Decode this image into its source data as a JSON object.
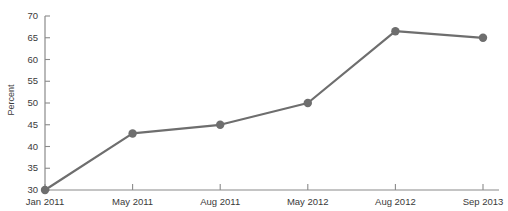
{
  "chart_data": {
    "type": "line",
    "title": "",
    "title_clipped": true,
    "xlabel": "",
    "ylabel": "Percent",
    "categories": [
      "Jan 2011",
      "May 2011",
      "Aug 2011",
      "May 2012",
      "Aug 2012",
      "Sep 2013"
    ],
    "values": [
      30,
      43,
      45,
      50,
      66.5,
      65
    ],
    "ylim": [
      30,
      70
    ],
    "yticks": [
      30,
      35,
      40,
      45,
      50,
      55,
      60,
      65,
      70
    ],
    "grid": false,
    "legend": null,
    "series": [
      {
        "name": "Percent",
        "values": [
          30,
          43,
          45,
          50,
          66.5,
          65
        ],
        "color": "#6e6e6e",
        "marker": "circle"
      }
    ]
  },
  "style": {
    "line_color": "#6e6e6e",
    "marker_color": "#6e6e6e",
    "axis_color": "#8a8a8a",
    "text_color": "#3a3a3a",
    "background": "#ffffff"
  }
}
